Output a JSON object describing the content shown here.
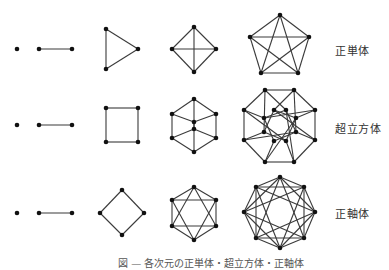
{
  "rows": [
    {
      "label": "正単体",
      "label_pos": [
        335,
        42
      ],
      "figures": [
        {
          "name": "0-simplex-point",
          "nodes": [
            [
              17,
              49
            ]
          ],
          "edges": []
        },
        {
          "name": "1-simplex-segment",
          "nodes": [
            [
              39,
              49
            ],
            [
              72,
              49
            ]
          ],
          "edges": [
            [
              0,
              1
            ]
          ]
        },
        {
          "name": "2-simplex-triangle",
          "nodes": [
            [
              106,
              29
            ],
            [
              106,
              69
            ],
            [
              138,
              49
            ]
          ],
          "edges": [
            [
              0,
              1
            ],
            [
              1,
              2
            ],
            [
              2,
              0
            ]
          ]
        },
        {
          "name": "3-simplex-tetrahedron",
          "nodes": [
            [
              194,
              27
            ],
            [
              172,
              49
            ],
            [
              216,
              49
            ],
            [
              194,
              72
            ]
          ],
          "edges": [
            [
              0,
              1
            ],
            [
              0,
              2
            ],
            [
              0,
              3
            ],
            [
              1,
              2
            ],
            [
              1,
              3
            ],
            [
              2,
              3
            ]
          ]
        },
        {
          "name": "4-simplex-pentachoron",
          "nodes": [
            [
              280,
              15
            ],
            [
              250,
              37
            ],
            [
              309,
              37
            ],
            [
              261,
              73
            ],
            [
              298,
              73
            ]
          ],
          "edges": [
            [
              0,
              1
            ],
            [
              0,
              2
            ],
            [
              0,
              3
            ],
            [
              0,
              4
            ],
            [
              1,
              2
            ],
            [
              1,
              3
            ],
            [
              1,
              4
            ],
            [
              2,
              3
            ],
            [
              2,
              4
            ],
            [
              3,
              4
            ]
          ]
        }
      ]
    },
    {
      "label": "超立方体",
      "label_pos": [
        335,
        120
      ],
      "figures": [
        {
          "name": "0-cube-point",
          "nodes": [
            [
              17,
              125
            ]
          ],
          "edges": []
        },
        {
          "name": "1-cube-segment",
          "nodes": [
            [
              39,
              125
            ],
            [
              72,
              125
            ]
          ],
          "edges": [
            [
              0,
              1
            ]
          ]
        },
        {
          "name": "2-cube-square",
          "nodes": [
            [
              106,
              108
            ],
            [
              138,
              108
            ],
            [
              138,
              142
            ],
            [
              106,
              142
            ]
          ],
          "edges": [
            [
              0,
              1
            ],
            [
              1,
              2
            ],
            [
              2,
              3
            ],
            [
              3,
              0
            ]
          ]
        },
        {
          "name": "3-cube",
          "nodes": [
            [
              194,
              99
            ],
            [
              172,
              114
            ],
            [
              216,
              114
            ],
            [
              194,
              122
            ],
            [
              194,
              129
            ],
            [
              172,
              138
            ],
            [
              216,
              138
            ],
            [
              194,
              152
            ]
          ],
          "edges": [
            [
              0,
              1
            ],
            [
              0,
              2
            ],
            [
              0,
              4
            ],
            [
              1,
              3
            ],
            [
              2,
              3
            ],
            [
              1,
              5
            ],
            [
              2,
              6
            ],
            [
              3,
              7
            ],
            [
              5,
              4
            ],
            [
              6,
              4
            ],
            [
              5,
              7
            ],
            [
              6,
              7
            ]
          ]
        },
        {
          "name": "4-cube-tesseract",
          "nodes": [
            [
              265,
              90
            ],
            [
              294,
              90
            ],
            [
              315,
              110
            ],
            [
              315,
              140
            ],
            [
              294,
              162
            ],
            [
              265,
              162
            ],
            [
              244,
              140
            ],
            [
              244,
              110
            ],
            [
              274,
              110
            ],
            [
              286,
              110
            ],
            [
              296,
              118
            ],
            [
              296,
              132
            ],
            [
              286,
              141
            ],
            [
              274,
              141
            ],
            [
              264,
              132
            ],
            [
              264,
              118
            ]
          ],
          "edges": [
            [
              0,
              1
            ],
            [
              1,
              2
            ],
            [
              2,
              3
            ],
            [
              3,
              4
            ],
            [
              4,
              5
            ],
            [
              5,
              6
            ],
            [
              6,
              7
            ],
            [
              7,
              0
            ],
            [
              8,
              10
            ],
            [
              10,
              12
            ],
            [
              12,
              14
            ],
            [
              14,
              8
            ],
            [
              9,
              11
            ],
            [
              11,
              13
            ],
            [
              13,
              15
            ],
            [
              15,
              9
            ],
            [
              0,
              9
            ],
            [
              0,
              14
            ],
            [
              1,
              8
            ],
            [
              1,
              11
            ],
            [
              2,
              10
            ],
            [
              2,
              15
            ],
            [
              3,
              11
            ],
            [
              3,
              8
            ],
            [
              4,
              12
            ],
            [
              4,
              9
            ],
            [
              5,
              13
            ],
            [
              5,
              10
            ],
            [
              6,
              14
            ],
            [
              6,
              11
            ],
            [
              7,
              15
            ],
            [
              7,
              12
            ]
          ]
        }
      ]
    },
    {
      "label": "正軸体",
      "label_pos": [
        335,
        205
      ],
      "figures": [
        {
          "name": "0-orthoplex-point",
          "nodes": [
            [
              17,
              213
            ]
          ],
          "edges": []
        },
        {
          "name": "1-orthoplex-segment",
          "nodes": [
            [
              39,
              213
            ],
            [
              72,
              213
            ]
          ],
          "edges": [
            [
              0,
              1
            ]
          ]
        },
        {
          "name": "2-orthoplex-square",
          "nodes": [
            [
              122,
              190
            ],
            [
              144,
              213
            ],
            [
              122,
              235
            ],
            [
              100,
              213
            ]
          ],
          "edges": [
            [
              0,
              1
            ],
            [
              1,
              2
            ],
            [
              2,
              3
            ],
            [
              3,
              0
            ]
          ]
        },
        {
          "name": "3-orthoplex-octahedron",
          "nodes": [
            [
              194,
              187
            ],
            [
              216,
              200
            ],
            [
              216,
              226
            ],
            [
              194,
              240
            ],
            [
              172,
              226
            ],
            [
              172,
              200
            ]
          ],
          "edges": [
            [
              0,
              1
            ],
            [
              0,
              2
            ],
            [
              0,
              4
            ],
            [
              0,
              5
            ],
            [
              1,
              2
            ],
            [
              1,
              3
            ],
            [
              1,
              5
            ],
            [
              2,
              3
            ],
            [
              2,
              4
            ],
            [
              3,
              4
            ],
            [
              3,
              5
            ],
            [
              4,
              5
            ]
          ]
        },
        {
          "name": "4-orthoplex-16-cell",
          "nodes": [
            [
              280,
              177
            ],
            [
              304,
              187
            ],
            [
              315,
              212
            ],
            [
              304,
              238
            ],
            [
              280,
              248
            ],
            [
              256,
              238
            ],
            [
              244,
              212
            ],
            [
              256,
              187
            ]
          ],
          "edges": [
            [
              0,
              1
            ],
            [
              0,
              2
            ],
            [
              0,
              3
            ],
            [
              0,
              5
            ],
            [
              0,
              6
            ],
            [
              0,
              7
            ],
            [
              1,
              2
            ],
            [
              1,
              3
            ],
            [
              1,
              4
            ],
            [
              1,
              6
            ],
            [
              1,
              7
            ],
            [
              2,
              3
            ],
            [
              2,
              4
            ],
            [
              2,
              5
            ],
            [
              2,
              7
            ],
            [
              3,
              4
            ],
            [
              3,
              5
            ],
            [
              3,
              6
            ],
            [
              4,
              5
            ],
            [
              4,
              6
            ],
            [
              4,
              7
            ],
            [
              5,
              6
            ],
            [
              5,
              7
            ],
            [
              6,
              7
            ]
          ]
        }
      ]
    }
  ],
  "caption": "図 — 各次元の正単体・超立方体・正軸体"
}
